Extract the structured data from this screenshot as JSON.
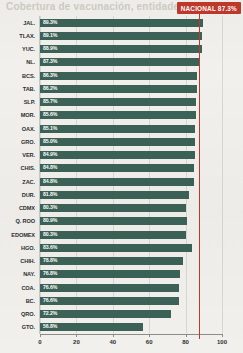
{
  "headline": "Cobertura de vacunación, entidades",
  "national": {
    "label": "NACIONAL",
    "value": 87.3,
    "value_text": "87.3%",
    "badge_text": "NACIONAL 87.3%",
    "color": "#c0392b"
  },
  "axis": {
    "ticks": [
      0,
      20,
      40,
      60,
      80,
      100
    ],
    "tick_labels": [
      "0",
      "20",
      "40",
      "60",
      "80",
      "100"
    ],
    "min": 0,
    "max": 100
  },
  "colors": {
    "bar": "#3c6257",
    "accent": "#c0392b",
    "background": "#f1f0ec",
    "grid": "#d8d7d0",
    "text": "#2f2f2f",
    "bar_label": "#ffffff"
  },
  "chart_data": {
    "type": "bar",
    "orientation": "horizontal",
    "title": "Cobertura de vacunación, entidades",
    "xlabel": "",
    "ylabel": "",
    "xlim": [
      0,
      100
    ],
    "grid": true,
    "legend": "none",
    "annotations": [
      {
        "text": "NACIONAL 87.3%",
        "value": 87.3,
        "type": "reference-line",
        "color": "#c0392b"
      }
    ],
    "categories": [
      "JAL.",
      "TLAX.",
      "YUC.",
      "NL.",
      "BCS.",
      "TAB.",
      "SLP.",
      "MOR.",
      "OAX.",
      "GRO.",
      "VER.",
      "CHIS.",
      "ZAC.",
      "DUR.",
      "CDMX",
      "Q. ROO",
      "EDOMEX",
      "HGO.",
      "CHIH.",
      "NAY.",
      "COA.",
      "BC.",
      "QRO.",
      "GTO."
    ],
    "values": [
      89.3,
      89.1,
      88.9,
      87.3,
      86.3,
      86.2,
      85.7,
      85.6,
      85.1,
      85.0,
      84.9,
      84.8,
      84.8,
      81.8,
      80.3,
      80.9,
      80.3,
      83.6,
      78.8,
      76.8,
      76.6,
      76.6,
      72.2,
      56.8
    ],
    "value_labels": [
      "89.3%",
      "89.1%",
      "88.9%",
      "87.3%",
      "86.3%",
      "86.2%",
      "85.7%",
      "85.6%",
      "85.1%",
      "85.0%",
      "84.9%",
      "84.8%",
      "84.8%",
      "81.8%",
      "80.3%",
      "80.9%",
      "80.3%",
      "83.6%",
      "78.8%",
      "76.8%",
      "76.6%",
      "76.6%",
      "72.2%",
      "56.8%"
    ]
  }
}
